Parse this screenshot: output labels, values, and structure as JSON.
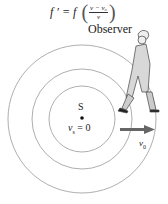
{
  "formula": {
    "lhs": "f ′ = f",
    "numerator": "v − v₀",
    "denominator": "v"
  },
  "labels": {
    "observer": "Observer",
    "source": "S",
    "source_velocity_var": "v",
    "source_velocity_sub": "s",
    "source_velocity_value": " = 0",
    "observer_velocity_var": "v",
    "observer_velocity_sub": "0"
  },
  "colors": {
    "wavefront": "#999999",
    "arrow": "#666666",
    "text": "#222222"
  },
  "wavefronts": [
    {
      "r": 33
    },
    {
      "r": 50
    },
    {
      "r": 74
    }
  ]
}
